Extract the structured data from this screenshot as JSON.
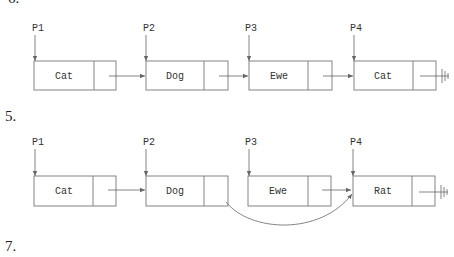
{
  "labels": {
    "top_cut": "6.",
    "step_5": "5.",
    "step_7": "7."
  },
  "diagram_1": {
    "pointers": [
      "P1",
      "P2",
      "P3",
      "P4"
    ],
    "nodes": [
      "Cat",
      "Dog",
      "Ewe",
      "Cat"
    ],
    "terminator": "null-ground-icon"
  },
  "diagram_2": {
    "pointers": [
      "P1",
      "P2",
      "P3",
      "P4"
    ],
    "nodes": [
      "Cat",
      "Dog",
      "Ewe",
      "Rat"
    ],
    "terminator": "null-ground-icon",
    "bypass_arrow": "Dog -> Rat"
  },
  "colors": {
    "stroke": "#777777",
    "text": "#333333",
    "background": "#ffffff"
  }
}
